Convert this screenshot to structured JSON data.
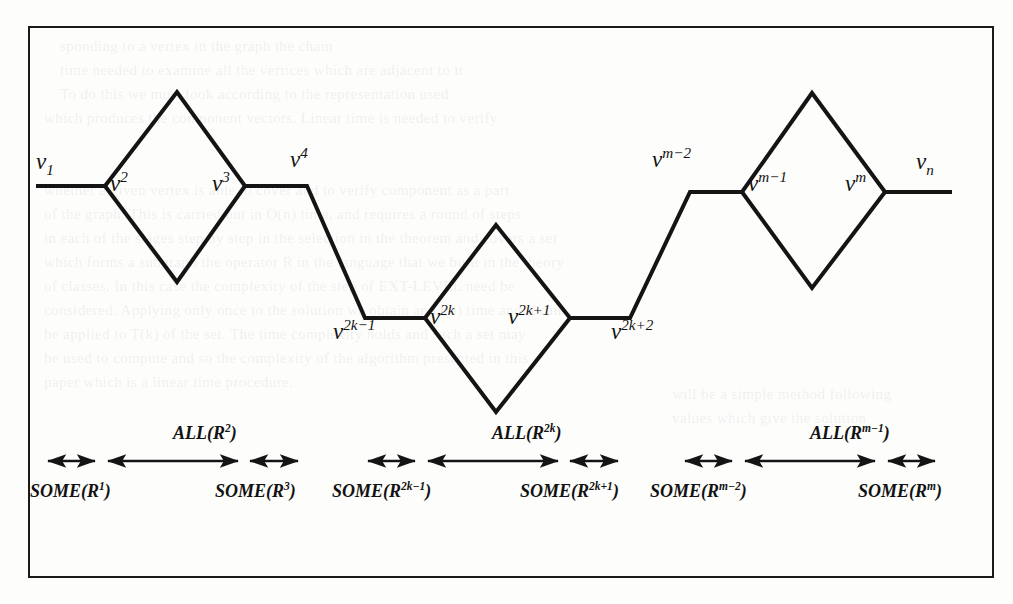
{
  "figure": {
    "type": "chain-of-diamonds graph diagram",
    "caption_present": false
  },
  "vertices": [
    {
      "id": "v1",
      "base": "v",
      "superscript": "",
      "subscript": "1",
      "text": "v₁",
      "x": 36,
      "y": 150
    },
    {
      "id": "v2",
      "base": "v",
      "superscript": "2",
      "subscript": "",
      "text": "v²",
      "x": 110,
      "y": 172
    },
    {
      "id": "v3",
      "base": "v",
      "superscript": "3",
      "subscript": "",
      "text": "v³",
      "x": 212,
      "y": 172
    },
    {
      "id": "v4",
      "base": "v",
      "superscript": "4",
      "subscript": "",
      "text": "v⁴",
      "x": 290,
      "y": 148
    },
    {
      "id": "v2k-1",
      "base": "v",
      "superscript": "2k−1",
      "subscript": "",
      "text": "v^{2k-1}",
      "x": 333,
      "y": 320
    },
    {
      "id": "v2k",
      "base": "v",
      "superscript": "2k",
      "subscript": "",
      "text": "v^{2k}",
      "x": 430,
      "y": 305
    },
    {
      "id": "v2k+1",
      "base": "v",
      "superscript": "2k+1",
      "subscript": "",
      "text": "v^{2k+1}",
      "x": 508,
      "y": 305
    },
    {
      "id": "v2k+2",
      "base": "v",
      "superscript": "2k+2",
      "subscript": "",
      "text": "v^{2k+2}",
      "x": 611,
      "y": 320
    },
    {
      "id": "vm-2",
      "base": "v",
      "superscript": "m−2",
      "subscript": "",
      "text": "v^{m-2}",
      "x": 652,
      "y": 148
    },
    {
      "id": "vm-1",
      "base": "v",
      "superscript": "m−1",
      "subscript": "",
      "text": "v^{m-1}",
      "x": 748,
      "y": 172
    },
    {
      "id": "vm",
      "base": "v",
      "superscript": "m",
      "subscript": "",
      "text": "v^{m}",
      "x": 845,
      "y": 172
    },
    {
      "id": "vn",
      "base": "v",
      "superscript": "",
      "subscript": "n",
      "text": "vₙ",
      "x": 916,
      "y": 150
    }
  ],
  "annotations": {
    "all_labels": [
      {
        "id": "all-R2",
        "base": "ALL",
        "arg": "R",
        "superscript": "2",
        "x": 173,
        "y": 424
      },
      {
        "id": "all-R2k",
        "base": "ALL",
        "arg": "R",
        "superscript": "2k",
        "x": 492,
        "y": 424
      },
      {
        "id": "all-Rm-1",
        "base": "ALL",
        "arg": "R",
        "superscript": "m−1",
        "x": 810,
        "y": 424
      }
    ],
    "some_labels": [
      {
        "id": "some-R1",
        "base": "SOME",
        "arg": "R",
        "superscript": "1",
        "x": 30,
        "y": 482
      },
      {
        "id": "some-R3",
        "base": "SOME",
        "arg": "R",
        "superscript": "3",
        "x": 215,
        "y": 482
      },
      {
        "id": "some-R2k-1",
        "base": "SOME",
        "arg": "R",
        "superscript": "2k−1",
        "x": 332,
        "y": 482
      },
      {
        "id": "some-R2k+1",
        "base": "SOME",
        "arg": "R",
        "superscript": "2k+1",
        "x": 520,
        "y": 482
      },
      {
        "id": "some-Rm-2",
        "base": "SOME",
        "arg": "R",
        "superscript": "m−2",
        "x": 650,
        "y": 482
      },
      {
        "id": "some-Rm",
        "base": "SOME",
        "arg": "R",
        "superscript": "m",
        "x": 858,
        "y": 482
      }
    ],
    "arrows": [
      {
        "id": "arrow-some-R1",
        "x1": 48,
        "x2": 95,
        "y": 461
      },
      {
        "id": "arrow-all-R2",
        "x1": 108,
        "x2": 238,
        "y": 461
      },
      {
        "id": "arrow-some-R3",
        "x1": 250,
        "x2": 298,
        "y": 461
      },
      {
        "id": "arrow-some-R2k-1",
        "x1": 368,
        "x2": 415,
        "y": 461
      },
      {
        "id": "arrow-all-R2k",
        "x1": 428,
        "x2": 558,
        "y": 461
      },
      {
        "id": "arrow-some-R2k+1",
        "x1": 570,
        "x2": 618,
        "y": 461
      },
      {
        "id": "arrow-some-Rm-2",
        "x1": 685,
        "x2": 732,
        "y": 461
      },
      {
        "id": "arrow-all-Rm-1",
        "x1": 745,
        "x2": 875,
        "y": 461
      },
      {
        "id": "arrow-some-Rm",
        "x1": 888,
        "x2": 935,
        "y": 461
      }
    ]
  },
  "graph_geometry": {
    "stroke_color": "#141414",
    "stroke_width": 4,
    "polyline_points": "36,186 105,186 177,92 245,186 307,186 365,318 425,318 496,225 570,318 630,318 690,192 742,192 812,93 885,192 952,192",
    "diamond_lower_paths": [
      "105,186 177,282 245,186",
      "425,318 496,412 570,318",
      "742,192 812,288 885,192"
    ]
  },
  "bleed_text": {
    "note": "faint show-through text from the reverse side of the scanned page",
    "lines": [
      {
        "text": "sponding to a vertex in the graph the chain",
        "x": 60,
        "y": 38
      },
      {
        "text": "time needed to examine all the vertices which are adjacent to it",
        "x": 60,
        "y": 62
      },
      {
        "text": "To do this we must look according to the representation used",
        "x": 60,
        "y": 86
      },
      {
        "text": "which produces the component vectors. Linear time is needed to verify",
        "x": 44,
        "y": 110
      },
      {
        "text": "whether a given vertex is able to cover and to verify component as a part",
        "x": 44,
        "y": 182
      },
      {
        "text": "of the graph. This is carried out in O(n) time, and requires a round of steps",
        "x": 44,
        "y": 206
      },
      {
        "text": "in each of the stages step by step in the selection in the theorem and covers a set",
        "x": 44,
        "y": 230
      },
      {
        "text": "which forms a subgraph the operator R in the language that we built in the theory",
        "x": 44,
        "y": 254
      },
      {
        "text": "of classes. In this case the complexity of the step of EXT-LEVEL need be",
        "x": 44,
        "y": 278
      },
      {
        "text": "considered. Applying only once to the solution we obtain an O(n) time and it can",
        "x": 44,
        "y": 302
      },
      {
        "text": "be applied to T(k) of the set. The time complexity holds and such a set may",
        "x": 44,
        "y": 326
      },
      {
        "text": "be used to compute and so the complexity of the algorithm presented in this",
        "x": 44,
        "y": 350
      },
      {
        "text": "paper which is a linear time procedure.",
        "x": 44,
        "y": 374
      },
      {
        "text": "will be a simple method following",
        "x": 672,
        "y": 386
      },
      {
        "text": "values which give the solution",
        "x": 672,
        "y": 410
      }
    ]
  }
}
